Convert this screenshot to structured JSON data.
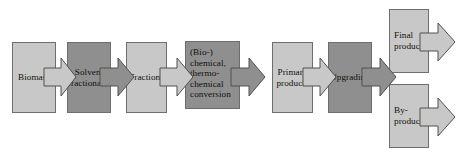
{
  "diagram": {
    "type": "process-flow",
    "background_color": "#ffffff",
    "palette": {
      "light_fill": "#c8c8c8",
      "dark_fill": "#8f8f8f",
      "outline": "#6e6e6e",
      "arrow_outline": "#55504b",
      "text": "#14100c"
    },
    "nodes": [
      {
        "id": "biomass",
        "label": "Biomass",
        "shade": "light",
        "align": "center",
        "x": 12,
        "y": 42,
        "w": 44,
        "h": 71
      },
      {
        "id": "solvent-fractionation",
        "label": "Solvent\nfractionation",
        "shade": "dark",
        "align": "center",
        "x": 67,
        "y": 42,
        "w": 44,
        "h": 71
      },
      {
        "id": "fractions",
        "label": "Fractions",
        "shade": "light",
        "align": "center",
        "x": 126,
        "y": 42,
        "w": 41,
        "h": 71
      },
      {
        "id": "conversion",
        "label": "(Bio-)\nchemical,\nthermo-\nchemical\nconversion",
        "shade": "dark",
        "align": "left-top",
        "x": 185,
        "y": 41,
        "w": 55,
        "h": 68
      },
      {
        "id": "primary-products",
        "label": "Primary\nproducts",
        "shade": "light",
        "align": "center",
        "x": 272,
        "y": 42,
        "w": 41,
        "h": 71
      },
      {
        "id": "upgrading",
        "label": "Upgrading",
        "shade": "dark",
        "align": "center",
        "x": 328,
        "y": 42,
        "w": 44,
        "h": 71
      },
      {
        "id": "final-products",
        "label": "Final\nproducts",
        "shade": "light",
        "align": "left",
        "x": 389,
        "y": 9,
        "w": 40,
        "h": 64
      },
      {
        "id": "by-products",
        "label": "By-\nproducts",
        "shade": "light",
        "align": "left",
        "x": 389,
        "y": 84,
        "w": 40,
        "h": 64
      }
    ],
    "arrows": [
      {
        "id": "biomass-to-solvent",
        "from": "biomass",
        "to": "solvent-fractionation",
        "shade": "light",
        "x": 44,
        "y": 58,
        "w": 32,
        "h": 38
      },
      {
        "id": "solvent-to-fractions",
        "from": "solvent-fractionation",
        "to": "fractions",
        "shade": "dark",
        "x": 100,
        "y": 58,
        "w": 34,
        "h": 38
      },
      {
        "id": "fractions-to-conversion",
        "from": "fractions",
        "to": "conversion",
        "shade": "light",
        "x": 160,
        "y": 58,
        "w": 33,
        "h": 38
      },
      {
        "id": "conversion-to-primary",
        "from": "conversion",
        "to": "primary-products",
        "shade": "dark",
        "x": 231,
        "y": 58,
        "w": 34,
        "h": 38
      },
      {
        "id": "primary-to-upgrading",
        "from": "primary-products",
        "to": "upgrading",
        "shade": "light",
        "x": 303,
        "y": 58,
        "w": 33,
        "h": 38
      },
      {
        "id": "upgrading-to-products",
        "from": "upgrading",
        "to": "products",
        "shade": "dark",
        "x": 362,
        "y": 58,
        "w": 34,
        "h": 38
      },
      {
        "id": "final-products-out",
        "from": "final-products",
        "to": "",
        "shade": "light",
        "x": 420,
        "y": 23,
        "w": 35,
        "h": 38
      },
      {
        "id": "by-products-out",
        "from": "by-products",
        "to": "",
        "shade": "light",
        "x": 420,
        "y": 98,
        "w": 35,
        "h": 38
      }
    ]
  }
}
